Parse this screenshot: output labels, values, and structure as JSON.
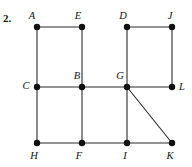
{
  "figure": {
    "problem_number": "2.",
    "background_color": "#ffffff",
    "edge_color": "#2b2b2b",
    "vertex_color": "#111111",
    "label_color": "#111111",
    "width": 192,
    "height": 167
  },
  "graph": {
    "type": "undirected-graph",
    "vertices": [
      {
        "id": "A",
        "label": "A",
        "x": 37,
        "y": 27,
        "label_x": 32,
        "label_y": 17,
        "anchor": "middle"
      },
      {
        "id": "E",
        "label": "E",
        "x": 82,
        "y": 27,
        "label_x": 78,
        "label_y": 17,
        "anchor": "middle"
      },
      {
        "id": "D",
        "label": "D",
        "x": 127,
        "y": 27,
        "label_x": 123,
        "label_y": 17,
        "anchor": "middle"
      },
      {
        "id": "J",
        "label": "J",
        "x": 172,
        "y": 27,
        "label_x": 170,
        "label_y": 17,
        "anchor": "middle"
      },
      {
        "id": "C",
        "label": "C",
        "x": 37,
        "y": 87,
        "label_x": 26,
        "label_y": 87,
        "anchor": "middle"
      },
      {
        "id": "B",
        "label": "B",
        "x": 82,
        "y": 87,
        "label_x": 77,
        "label_y": 77,
        "anchor": "middle"
      },
      {
        "id": "G",
        "label": "G",
        "x": 127,
        "y": 87,
        "label_x": 120,
        "label_y": 77,
        "anchor": "middle"
      },
      {
        "id": "L",
        "label": "L",
        "x": 172,
        "y": 87,
        "label_x": 182,
        "label_y": 88,
        "anchor": "middle"
      },
      {
        "id": "H",
        "label": "H",
        "x": 37,
        "y": 143,
        "label_x": 34,
        "label_y": 157,
        "anchor": "middle"
      },
      {
        "id": "F",
        "label": "F",
        "x": 82,
        "y": 143,
        "label_x": 79,
        "label_y": 157,
        "anchor": "middle"
      },
      {
        "id": "I",
        "label": "I",
        "x": 127,
        "y": 143,
        "label_x": 125,
        "label_y": 157,
        "anchor": "middle"
      },
      {
        "id": "K",
        "label": "K",
        "x": 172,
        "y": 143,
        "label_x": 170,
        "label_y": 157,
        "anchor": "middle"
      }
    ],
    "edges": [
      {
        "from": "A",
        "to": "E",
        "name": "edge-A-E"
      },
      {
        "from": "D",
        "to": "J",
        "name": "edge-D-J"
      },
      {
        "from": "A",
        "to": "C",
        "name": "edge-A-C"
      },
      {
        "from": "E",
        "to": "B",
        "name": "edge-E-B"
      },
      {
        "from": "D",
        "to": "G",
        "name": "edge-D-G"
      },
      {
        "from": "J",
        "to": "L",
        "name": "edge-J-L"
      },
      {
        "from": "C",
        "to": "B",
        "name": "edge-C-B"
      },
      {
        "from": "B",
        "to": "G",
        "name": "edge-B-G"
      },
      {
        "from": "G",
        "to": "L",
        "name": "edge-G-L"
      },
      {
        "from": "C",
        "to": "H",
        "name": "edge-C-H"
      },
      {
        "from": "B",
        "to": "F",
        "name": "edge-B-F"
      },
      {
        "from": "G",
        "to": "I",
        "name": "edge-G-I"
      },
      {
        "from": "H",
        "to": "F",
        "name": "edge-H-F"
      },
      {
        "from": "F",
        "to": "I",
        "name": "edge-F-I"
      },
      {
        "from": "I",
        "to": "K",
        "name": "edge-I-K"
      },
      {
        "from": "G",
        "to": "K",
        "name": "edge-G-K"
      }
    ],
    "vertex_radius": 3.2
  }
}
